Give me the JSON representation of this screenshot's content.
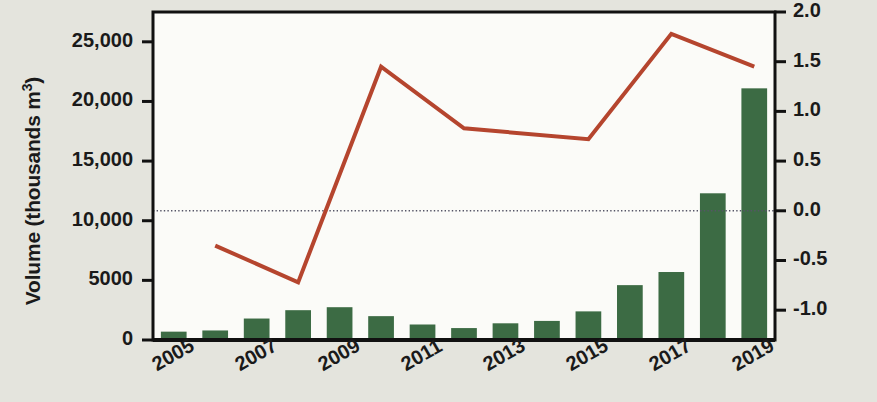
{
  "chart_data": {
    "type": "bar",
    "title": "",
    "subtitle": "",
    "xlabel": "",
    "ylabel": "Volume (thousands m³)",
    "ylabel_right": "Temperature ( °C)",
    "grid": false,
    "legend": "none",
    "x": [
      2005,
      2006,
      2007,
      2008,
      2009,
      2010,
      2011,
      2012,
      2013,
      2014,
      2015,
      2016,
      2017,
      2018,
      2019
    ],
    "xtick_labels": [
      "2005",
      "2007",
      "2009",
      "2011",
      "2013",
      "2015",
      "2017",
      "2019"
    ],
    "xtick_values": [
      2005,
      2007,
      2009,
      2011,
      2013,
      2015,
      2017,
      2019
    ],
    "ylim": [
      0,
      27500
    ],
    "ytick_labels": [
      "0",
      "5000",
      "10,000",
      "15,000",
      "20,000",
      "25,000"
    ],
    "ytick_values": [
      0,
      5000,
      10000,
      15000,
      20000,
      25000
    ],
    "ylim_right": [
      -1.3,
      2.0
    ],
    "ytick_labels_right": [
      "-1.0",
      "-0.5",
      "0.0",
      "0.5",
      "1.0",
      "1.5",
      "2.0"
    ],
    "ytick_values_right": [
      -1.0,
      -0.5,
      0.0,
      0.5,
      1.0,
      1.5,
      2.0
    ],
    "zero_line_value": 0.0,
    "series": [
      {
        "name": "Volume",
        "type": "bar",
        "axis": "left",
        "color": "#3c6b44",
        "categories": [
          2005,
          2006,
          2007,
          2008,
          2009,
          2010,
          2011,
          2012,
          2013,
          2014,
          2015,
          2016,
          2017,
          2018,
          2019
        ],
        "values": [
          700,
          800,
          1800,
          2500,
          2750,
          2000,
          1300,
          1000,
          1400,
          1600,
          2400,
          4600,
          5700,
          12300,
          21100
        ]
      },
      {
        "name": "Temperature",
        "type": "line",
        "axis": "right",
        "color": "#b5452e",
        "x": [
          2006,
          2008,
          2010,
          2012,
          2015,
          2017,
          2019
        ],
        "values": [
          -0.35,
          -0.72,
          1.45,
          0.83,
          0.72,
          1.78,
          1.45
        ]
      }
    ]
  },
  "axes": {
    "left_title": "Volume (thousands m",
    "left_title_sup": "3",
    "left_title_end": ")",
    "right_title": "Temperature ( °C)"
  },
  "colors": {
    "bar": "#3c6b44",
    "line": "#b5452e",
    "background": "#e4e4dd",
    "plot_background": "#fbfbf8",
    "axis": "#111111",
    "zero_line": "#555566"
  }
}
